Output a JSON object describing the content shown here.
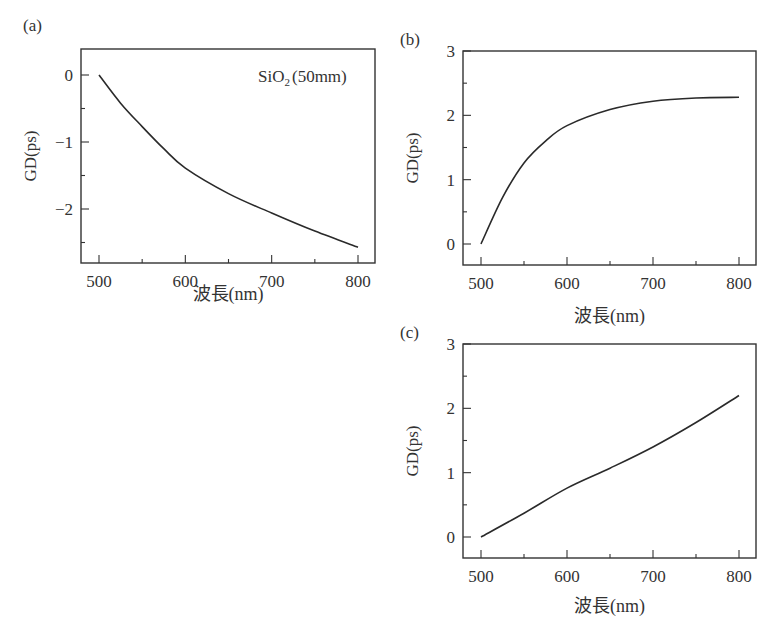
{
  "figure": {
    "panels": [
      {
        "id": "a",
        "label": "(a)",
        "annotation": {
          "base": "SiO",
          "sub": "2",
          "rest": "(50mm)"
        },
        "frame": {
          "left": 81,
          "top": 49,
          "right": 375,
          "bottom": 263
        },
        "xmap": {
          "v0": 500,
          "p0": 99,
          "v1": 800,
          "p1": 358
        },
        "ymap": {
          "v0": 0,
          "p0": 75,
          "v1": -2,
          "p1": 209
        },
        "yticks_major": [
          0,
          -1,
          -2
        ],
        "yticks_minor": [
          -0.5,
          -1.5,
          -2.5
        ],
        "ytick_labels": [
          "0",
          "−1",
          "−2"
        ],
        "xlabel_y": 300
      },
      {
        "id": "b",
        "label": "(b)",
        "frame": {
          "left": 463,
          "top": 51,
          "right": 756,
          "bottom": 265
        },
        "xmap": {
          "v0": 500,
          "p0": 481,
          "v1": 800,
          "p1": 739
        },
        "ymap": {
          "v0": 0,
          "p0": 244,
          "v1": 3,
          "p1": 51
        },
        "yticks_major": [
          0,
          1,
          2,
          3
        ],
        "yticks_minor": [
          0.5,
          1.5,
          2.5
        ],
        "ytick_labels": [
          "0",
          "1",
          "2",
          "3"
        ],
        "xlabel_y": 322
      },
      {
        "id": "c",
        "label": "(c)",
        "frame": {
          "left": 463,
          "top": 344,
          "right": 756,
          "bottom": 558
        },
        "xmap": {
          "v0": 500,
          "p0": 481,
          "v1": 800,
          "p1": 739
        },
        "ymap": {
          "v0": 0,
          "p0": 537,
          "v1": 3,
          "p1": 344
        },
        "yticks_major": [
          0,
          1,
          2,
          3
        ],
        "yticks_minor": [
          0.5,
          1.5,
          2.5
        ],
        "ytick_labels": [
          "0",
          "1",
          "2",
          "3"
        ],
        "xlabel_y": 612
      }
    ]
  },
  "chart_data": [
    {
      "type": "line",
      "title": "(a)",
      "annotation": "SiO2 (50mm)",
      "xlabel": "波長(nm)",
      "ylabel": "GD(ps)",
      "xlim": [
        480,
        820
      ],
      "ylim": [
        -2.8,
        0.4
      ],
      "xticks": [
        500,
        600,
        700,
        800
      ],
      "yticks": [
        0,
        -1,
        -2
      ],
      "grid": false,
      "x": [
        500,
        525,
        550,
        575,
        600,
        650,
        700,
        750,
        800
      ],
      "series": [
        {
          "name": "GD",
          "values": [
            0,
            -0.42,
            -0.77,
            -1.1,
            -1.39,
            -1.77,
            -2.06,
            -2.33,
            -2.57
          ]
        }
      ]
    },
    {
      "type": "line",
      "title": "(b)",
      "xlabel": "波長(nm)",
      "ylabel": "GD(ps)",
      "xlim": [
        480,
        820
      ],
      "ylim": [
        -0.3,
        3
      ],
      "xticks": [
        500,
        600,
        700,
        800
      ],
      "yticks": [
        0,
        1,
        2,
        3
      ],
      "grid": false,
      "x": [
        500,
        525,
        550,
        575,
        600,
        650,
        700,
        750,
        800
      ],
      "series": [
        {
          "name": "GD",
          "values": [
            0,
            0.72,
            1.26,
            1.6,
            1.84,
            2.09,
            2.22,
            2.27,
            2.28
          ]
        }
      ]
    },
    {
      "type": "line",
      "title": "(c)",
      "xlabel": "波長(nm)",
      "ylabel": "GD(ps)",
      "xlim": [
        480,
        820
      ],
      "ylim": [
        -0.3,
        3
      ],
      "xticks": [
        500,
        600,
        700,
        800
      ],
      "yticks": [
        0,
        1,
        2,
        3
      ],
      "grid": false,
      "x": [
        500,
        550,
        600,
        650,
        700,
        750,
        800
      ],
      "series": [
        {
          "name": "GD",
          "values": [
            0,
            0.37,
            0.76,
            1.07,
            1.4,
            1.78,
            2.2
          ]
        }
      ]
    }
  ]
}
